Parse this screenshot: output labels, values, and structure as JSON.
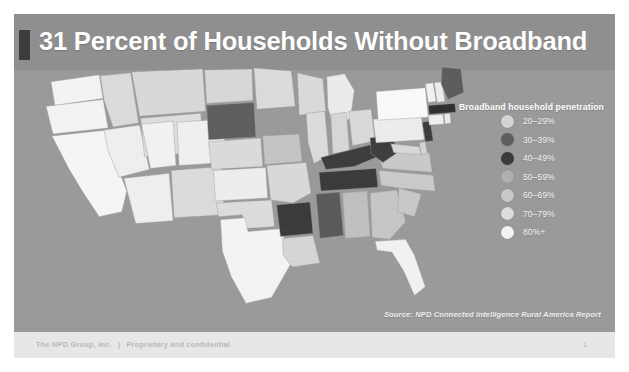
{
  "slide": {
    "title": "31 Percent of Households Without Broadband",
    "source": "Source: NPD Connected Intelligence Rural America Report",
    "footer": {
      "company": "The NPD Group, Inc.",
      "separator": "|",
      "confidentiality": "Proprietary and confidential",
      "page_number": "1"
    },
    "background_color": "#9a9a9a",
    "title_bar_color": "#8f8f8f",
    "accent_color": "#3b3b3b"
  },
  "legend": {
    "title": "Broadband household penetration",
    "items": [
      {
        "label": "20–29%",
        "color": "#d6d6d6"
      },
      {
        "label": "30–39%",
        "color": "#5e5e5e"
      },
      {
        "label": "40–49%",
        "color": "#3a3a3a"
      },
      {
        "label": "50–59%",
        "color": "#b0b0b0"
      },
      {
        "label": "60–69%",
        "color": "#c9c9c9"
      },
      {
        "label": "70–79%",
        "color": "#dedede"
      },
      {
        "label": "80%+",
        "color": "#f4f4f4"
      }
    ]
  },
  "chart_data": {
    "type": "map",
    "title": "31 Percent of Households Without Broadband",
    "subtitle": "",
    "legend_title": "Broadband household penetration",
    "legend_position": "right",
    "value_label": "Broadband household penetration",
    "bins": [
      {
        "range": "20–29%",
        "color": "#d6d6d6"
      },
      {
        "range": "30–39%",
        "color": "#5e5e5e"
      },
      {
        "range": "40–49%",
        "color": "#3a3a3a"
      },
      {
        "range": "50–59%",
        "color": "#b0b0b0"
      },
      {
        "range": "60–69%",
        "color": "#c9c9c9"
      },
      {
        "range": "70–79%",
        "color": "#dedede"
      },
      {
        "range": "80%+",
        "color": "#f4f4f4"
      }
    ],
    "regions": [
      {
        "id": "WA",
        "name": "Washington",
        "bin": "80%+",
        "color": "#f4f4f4"
      },
      {
        "id": "OR",
        "name": "Oregon",
        "bin": "80%+",
        "color": "#f4f4f4"
      },
      {
        "id": "CA",
        "name": "California",
        "bin": "80%+",
        "color": "#f6f6f6"
      },
      {
        "id": "NV",
        "name": "Nevada",
        "bin": "80%+",
        "color": "#efefef"
      },
      {
        "id": "ID",
        "name": "Idaho",
        "bin": "70–79%",
        "color": "#dcdcdc"
      },
      {
        "id": "MT",
        "name": "Montana",
        "bin": "70–79%",
        "color": "#d9d9d9"
      },
      {
        "id": "WY",
        "name": "Wyoming",
        "bin": "70–79%",
        "color": "#dedede"
      },
      {
        "id": "UT",
        "name": "Utah",
        "bin": "80%+",
        "color": "#f2f2f2"
      },
      {
        "id": "AZ",
        "name": "Arizona",
        "bin": "80%+",
        "color": "#efefef"
      },
      {
        "id": "CO",
        "name": "Colorado",
        "bin": "80%+",
        "color": "#f0f0f0"
      },
      {
        "id": "NM",
        "name": "New Mexico",
        "bin": "70–79%",
        "color": "#dcdcdc"
      },
      {
        "id": "ND",
        "name": "North Dakota",
        "bin": "70–79%",
        "color": "#d8d8d8"
      },
      {
        "id": "SD",
        "name": "South Dakota",
        "bin": "30–39%",
        "color": "#5e5e5e"
      },
      {
        "id": "NE",
        "name": "Nebraska",
        "bin": "70–79%",
        "color": "#dbdbdb"
      },
      {
        "id": "KS",
        "name": "Kansas",
        "bin": "80%+",
        "color": "#eeeeee"
      },
      {
        "id": "OK",
        "name": "Oklahoma",
        "bin": "70–79%",
        "color": "#dddddd"
      },
      {
        "id": "TX",
        "name": "Texas",
        "bin": "80%+",
        "color": "#f4f4f4"
      },
      {
        "id": "MN",
        "name": "Minnesota",
        "bin": "70–79%",
        "color": "#dcdcdc"
      },
      {
        "id": "IA",
        "name": "Iowa",
        "bin": "60–69%",
        "color": "#c4c4c4"
      },
      {
        "id": "MO",
        "name": "Missouri",
        "bin": "70–79%",
        "color": "#d9d9d9"
      },
      {
        "id": "AR",
        "name": "Arkansas",
        "bin": "40–49%",
        "color": "#3a3a3a"
      },
      {
        "id": "LA",
        "name": "Louisiana",
        "bin": "70–79%",
        "color": "#d6d6d6"
      },
      {
        "id": "WI",
        "name": "Wisconsin",
        "bin": "70–79%",
        "color": "#dadada"
      },
      {
        "id": "IL",
        "name": "Illinois",
        "bin": "70–79%",
        "color": "#dcdcdc"
      },
      {
        "id": "MI",
        "name": "Michigan",
        "bin": "80%+",
        "color": "#ececec"
      },
      {
        "id": "IN",
        "name": "Indiana",
        "bin": "70–79%",
        "color": "#d7d7d7"
      },
      {
        "id": "OH",
        "name": "Ohio",
        "bin": "70–79%",
        "color": "#dadada"
      },
      {
        "id": "KY",
        "name": "Kentucky",
        "bin": "40–49%",
        "color": "#3c3c3c"
      },
      {
        "id": "TN",
        "name": "Tennessee",
        "bin": "40–49%",
        "color": "#3a3a3a"
      },
      {
        "id": "MS",
        "name": "Mississippi",
        "bin": "30–39%",
        "color": "#5a5a5a"
      },
      {
        "id": "AL",
        "name": "Alabama",
        "bin": "60–69%",
        "color": "#c0c0c0"
      },
      {
        "id": "GA",
        "name": "Georgia",
        "bin": "60–69%",
        "color": "#c6c6c6"
      },
      {
        "id": "FL",
        "name": "Florida",
        "bin": "80%+",
        "color": "#f2f2f2"
      },
      {
        "id": "SC",
        "name": "South Carolina",
        "bin": "60–69%",
        "color": "#c8c8c8"
      },
      {
        "id": "NC",
        "name": "North Carolina",
        "bin": "60–69%",
        "color": "#cacaca"
      },
      {
        "id": "VA",
        "name": "Virginia",
        "bin": "60–69%",
        "color": "#c9c9c9"
      },
      {
        "id": "WV",
        "name": "West Virginia",
        "bin": "40–49%",
        "color": "#3d3d3d"
      },
      {
        "id": "MD",
        "name": "Maryland",
        "bin": "70–79%",
        "color": "#d8d8d8"
      },
      {
        "id": "DE",
        "name": "Delaware",
        "bin": "70–79%",
        "color": "#d5d5d5"
      },
      {
        "id": "PA",
        "name": "Pennsylvania",
        "bin": "80%+",
        "color": "#ededed"
      },
      {
        "id": "NJ",
        "name": "New Jersey",
        "bin": "40–49%",
        "color": "#3b3b3b"
      },
      {
        "id": "NY",
        "name": "New York",
        "bin": "80%+",
        "color": "#fafafa"
      },
      {
        "id": "CT",
        "name": "Connecticut",
        "bin": "80%+",
        "color": "#f0f0f0"
      },
      {
        "id": "RI",
        "name": "Rhode Island",
        "bin": "80%+",
        "color": "#ececec"
      },
      {
        "id": "MA",
        "name": "Massachusetts",
        "bin": "40–49%",
        "color": "#2f2f2f"
      },
      {
        "id": "VT",
        "name": "Vermont",
        "bin": "80%+",
        "color": "#f2f2f2"
      },
      {
        "id": "NH",
        "name": "New Hampshire",
        "bin": "80%+",
        "color": "#ededed"
      },
      {
        "id": "ME",
        "name": "Maine",
        "bin": "30–39%",
        "color": "#5c5c5c"
      }
    ]
  }
}
